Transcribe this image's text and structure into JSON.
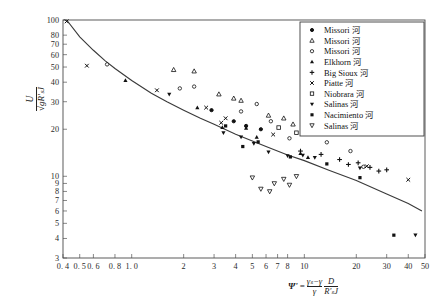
{
  "chart_data": {
    "type": "scatter",
    "title": "",
    "xlabel": "Ψ' = (γs − γ)/γ · D/(R's J)",
    "ylabel": "U / √(g R's J)",
    "xscale": "log",
    "yscale": "log",
    "xlim": [
      0.4,
      50
    ],
    "ylim": [
      3,
      100
    ],
    "grid": false,
    "legend_position": "top-right",
    "xticks": [
      0.4,
      0.5,
      0.6,
      0.8,
      1.0,
      2,
      3,
      4,
      5,
      6,
      7,
      8,
      10,
      20,
      30,
      40,
      50
    ],
    "xtick_labels": [
      "0. 4",
      "0. 5",
      "0. 6",
      "0. 8",
      "1. 0",
      "2",
      "3",
      "4",
      "5",
      "6",
      "7",
      "8",
      "10",
      "20",
      "30",
      "40",
      "50"
    ],
    "yticks": [
      3,
      4,
      5,
      6,
      7,
      8,
      9,
      10,
      20,
      30,
      40,
      50,
      60,
      70,
      80,
      100
    ],
    "ytick_labels": [
      "3",
      "4",
      "5",
      "6",
      "7",
      "8",
      "9",
      "10",
      "20",
      "30",
      "40",
      "50",
      "60",
      "70",
      "80",
      "100"
    ],
    "fit_curve": {
      "name": "regression-curve",
      "points": [
        [
          0.42,
          100
        ],
        [
          0.5,
          78
        ],
        [
          0.6,
          64
        ],
        [
          0.7,
          55
        ],
        [
          0.8,
          49
        ],
        [
          1.0,
          41
        ],
        [
          1.3,
          34
        ],
        [
          1.6,
          30
        ],
        [
          2.0,
          26.5
        ],
        [
          2.5,
          23.5
        ],
        [
          3.0,
          21.5
        ],
        [
          4.0,
          18.6
        ],
        [
          5.0,
          16.8
        ],
        [
          6.0,
          15.5
        ],
        [
          8.0,
          13.7
        ],
        [
          10,
          12.6
        ],
        [
          14,
          10.9
        ],
        [
          20,
          9.4
        ],
        [
          30,
          7.7
        ],
        [
          40,
          6.7
        ],
        [
          48,
          6.0
        ]
      ]
    },
    "series": [
      {
        "name": "Missori 河",
        "marker": "filled-circle",
        "points": [
          [
            2.9,
            26.5
          ],
          [
            3.9,
            22.5
          ],
          [
            4.6,
            21.0
          ],
          [
            5.6,
            20.0
          ]
        ]
      },
      {
        "name": "Missori 河",
        "marker": "open-triangle-up",
        "points": [
          [
            1.75,
            48
          ],
          [
            2.3,
            47
          ],
          [
            3.2,
            33.5
          ],
          [
            3.9,
            31.5
          ],
          [
            4.3,
            30.5
          ],
          [
            6.2,
            24.5
          ],
          [
            7.6,
            23.5
          ],
          [
            8.6,
            21.5
          ],
          [
            11.5,
            22.0
          ],
          [
            15.5,
            19.5
          ]
        ]
      },
      {
        "name": "Missori 河",
        "marker": "open-circle",
        "points": [
          [
            0.72,
            52
          ],
          [
            1.9,
            36.5
          ],
          [
            2.3,
            37.5
          ],
          [
            4.3,
            26.0
          ],
          [
            6.4,
            22.5
          ],
          [
            8.2,
            17.5
          ],
          [
            5.3,
            29.0
          ],
          [
            13.5,
            16.5
          ],
          [
            18.5,
            14.5
          ],
          [
            22,
            11.5
          ]
        ]
      },
      {
        "name": "Elkhorn 河",
        "marker": "filled-triangle-up",
        "points": [
          [
            0.92,
            41
          ],
          [
            2.4,
            27.5
          ],
          [
            3.35,
            20.5
          ],
          [
            4.6,
            20.3
          ],
          [
            5.3,
            17.8
          ],
          [
            9.5,
            14.0
          ],
          [
            10.5,
            13.2
          ]
        ]
      },
      {
        "name": "Big Sioux 河",
        "marker": "plus",
        "points": [
          [
            9.5,
            14.5
          ],
          [
            12.5,
            13.8
          ],
          [
            16,
            12.8
          ],
          [
            18,
            11.9
          ],
          [
            20.5,
            12.2
          ],
          [
            24,
            11.4
          ],
          [
            27,
            10.8
          ],
          [
            30,
            11.0
          ]
        ]
      },
      {
        "name": "Piatte 河",
        "marker": "cross",
        "points": [
          [
            0.42,
            98
          ],
          [
            0.55,
            51
          ],
          [
            1.4,
            35.5
          ],
          [
            2.7,
            27.5
          ],
          [
            3.3,
            22.0
          ],
          [
            3.5,
            23.5
          ],
          [
            6.6,
            18.5
          ],
          [
            23,
            11.6
          ],
          [
            40,
            9.5
          ]
        ]
      },
      {
        "name": "Niobrara 河",
        "marker": "open-square",
        "points": [
          [
            7.1,
            20.5
          ],
          [
            9.0,
            19.0
          ]
        ]
      },
      {
        "name": "Salinas 河",
        "marker": "filled-triangle-down",
        "points": [
          [
            1.65,
            33.5
          ],
          [
            3.4,
            19.0
          ],
          [
            4.3,
            17.8
          ],
          [
            5.1,
            16.2
          ],
          [
            6.2,
            14.3
          ],
          [
            8.0,
            13.5
          ],
          [
            9.8,
            13.6
          ],
          [
            11.5,
            13.2
          ],
          [
            21,
            11.3
          ],
          [
            44,
            4.2
          ]
        ]
      },
      {
        "name": "Nacimiento 河",
        "marker": "filled-square",
        "points": [
          [
            3.5,
            21.0
          ],
          [
            4.4,
            15.5
          ],
          [
            5.4,
            16.6
          ],
          [
            8.3,
            13.3
          ],
          [
            13.5,
            12.0
          ],
          [
            21,
            9.8
          ],
          [
            33,
            4.2
          ]
        ]
      },
      {
        "name": "Salinas 河",
        "marker": "open-triangle-down",
        "points": [
          [
            5.0,
            9.8
          ],
          [
            5.6,
            8.3
          ],
          [
            6.3,
            8.0
          ],
          [
            6.7,
            9.0
          ],
          [
            7.6,
            9.6
          ],
          [
            8.2,
            8.8
          ],
          [
            9.0,
            10.0
          ]
        ]
      }
    ]
  },
  "axis": {
    "ylabel_numerator": "U",
    "ylabel_denominator": "√gR'ₛJ",
    "xlabel_psi": "Ψ'",
    "xlabel_eq": "=",
    "xlabel_f1_num": "γₛ−γ",
    "xlabel_f1_den": "γ",
    "xlabel_f2_num": "D",
    "xlabel_f2_den": "R'ₛJ"
  }
}
